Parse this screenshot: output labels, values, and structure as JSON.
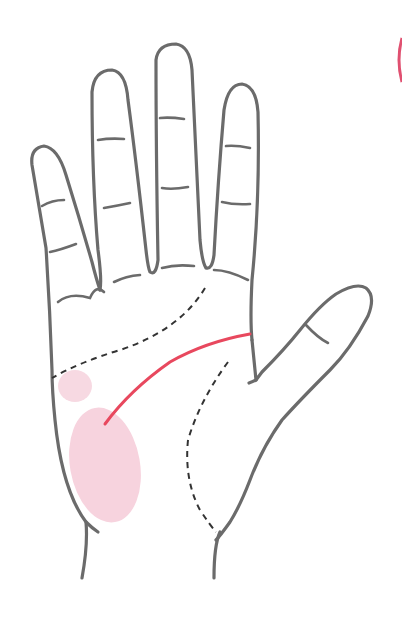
{
  "figure": {
    "colors": {
      "outline": "#6b6b6b",
      "dashed_lines": "#333333",
      "highlight_line": "#e8485e",
      "mount_fill": "#f7d3de",
      "corner_mark": "#e05070"
    }
  }
}
